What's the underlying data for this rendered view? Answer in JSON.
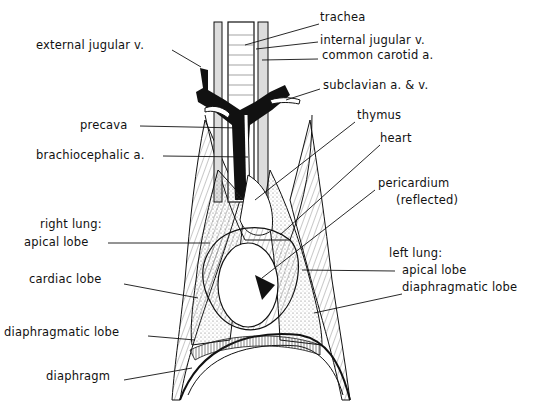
{
  "diagram": {
    "colors": {
      "ink": "#111111",
      "background": "#ffffff",
      "stipple": "#d9d9d9"
    },
    "labels": {
      "trachea": "trachea",
      "internal_jugular": "internal  jugular  v.",
      "common_carotid": "common  carotid  a.",
      "subclavian": "subclavian  a. & v.",
      "external_jugular": "external  jugular  v.",
      "precava": "precava",
      "brachiocephalic": "brachiocephalic  a.",
      "thymus": "thymus",
      "heart": "heart",
      "pericardium": "pericardium",
      "pericardium_note": "(reflected)",
      "right_lung": "right  lung:",
      "right_apical": "apical  lobe",
      "cardiac_lobe": "cardiac  lobe",
      "right_diaphragmatic": "diaphragmatic  lobe",
      "diaphragm": "diaphragm",
      "left_lung": "left  lung:",
      "left_apical": "apical  lobe",
      "left_diaphragmatic": "diaphragmatic  lobe"
    }
  }
}
